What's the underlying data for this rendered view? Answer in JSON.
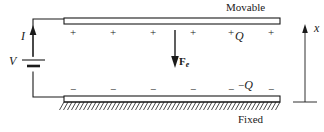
{
  "figure": {
    "colors": {
      "ink": "#1a1a1a",
      "plate_fill": "#ffffff",
      "background": "#ffffff"
    }
  },
  "plates": {
    "top": {
      "label": "Movable",
      "charge_label_sign": "+",
      "charge_label_symbol": "Q",
      "polarity_signs": [
        "+",
        "+",
        "+",
        "+",
        "+",
        "+"
      ]
    },
    "bottom": {
      "label": "Fixed",
      "charge_label_sign": "−",
      "charge_label_symbol": "Q",
      "polarity_signs": [
        "−",
        "−",
        "−",
        "−",
        "−",
        "−"
      ]
    }
  },
  "circuit": {
    "source_label": "V",
    "current_label": "I",
    "current_direction": "up"
  },
  "force": {
    "symbol": "F",
    "subscript": "e",
    "direction": "down"
  },
  "axis": {
    "label": "x",
    "direction": "up"
  }
}
